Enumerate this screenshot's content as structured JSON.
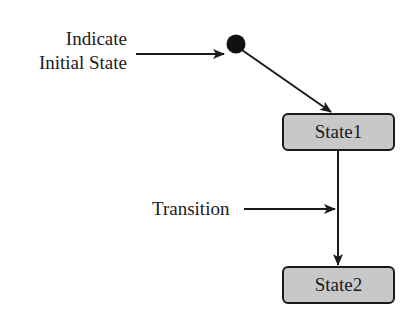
{
  "diagram": {
    "type": "UML state diagram",
    "annotations": {
      "initial_state_label_line1": "Indicate",
      "initial_state_label_line2": "Initial State",
      "transition_label": "Transition"
    },
    "states": [
      {
        "id": "State1",
        "label": "State1"
      },
      {
        "id": "State2",
        "label": "State2"
      }
    ],
    "transitions": [
      {
        "from": "initial",
        "to": "State1"
      },
      {
        "from": "State1",
        "to": "State2"
      }
    ],
    "colors": {
      "state_fill": "#c8c8c8",
      "stroke": "#1a1a1a",
      "background": "#ffffff"
    }
  }
}
